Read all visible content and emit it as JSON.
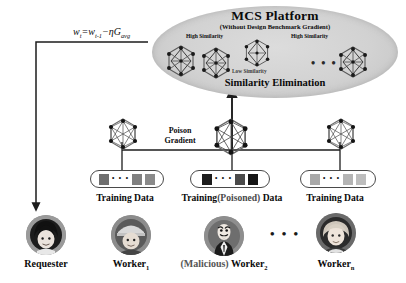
{
  "platform": {
    "title": "MCS Platform",
    "subtitle": "(Without Design Benchmark Gradient)",
    "footer": "Similarity Elimination",
    "sim_high_left": "High Similarity",
    "sim_high_right": "High Similarity",
    "sim_low": "Low Similarity",
    "ellipsis": "• • •"
  },
  "formula": {
    "text": "w",
    "sub_t": "t",
    "eq": "=w",
    "sub_t1": "t-1",
    "minus_eta_g": "−ηG",
    "sub_avg": "avg"
  },
  "poison": {
    "label_line1": "Poison",
    "label_line2": "Gradient"
  },
  "datasets": [
    {
      "label": "Training Data",
      "chips": [
        "#6f6f6f",
        "#808080",
        "#8a8a8a"
      ],
      "dots": "• • •"
    },
    {
      "label_pre": "Training",
      "label_mid": "(Poisoned)",
      "label_post": " Data",
      "chips": [
        "#1d1d1d",
        "#4a4a4a",
        "#151515"
      ],
      "dots": "• • •"
    },
    {
      "label": "Training Data",
      "chips": [
        "#a9a9a9",
        "#b4b4b4",
        "#bdbdbd"
      ],
      "dots": "• • •"
    }
  ],
  "people": [
    {
      "label": "Requester",
      "sub": "",
      "icon": "requester-avatar"
    },
    {
      "label": "Worker",
      "sub": "1",
      "icon": "worker-avatar"
    },
    {
      "label_prefix": "(Malicious)",
      "label": " Worker",
      "sub": "2",
      "icon": "malicious-worker-avatar"
    },
    {
      "label": "Worker",
      "sub": "n",
      "icon": "worker-n-avatar"
    }
  ],
  "colors": {
    "ellipse_fill": "#d2d2d2",
    "stroke": "#2a2a2a",
    "poisoned_chip": "#1d1d1d"
  }
}
